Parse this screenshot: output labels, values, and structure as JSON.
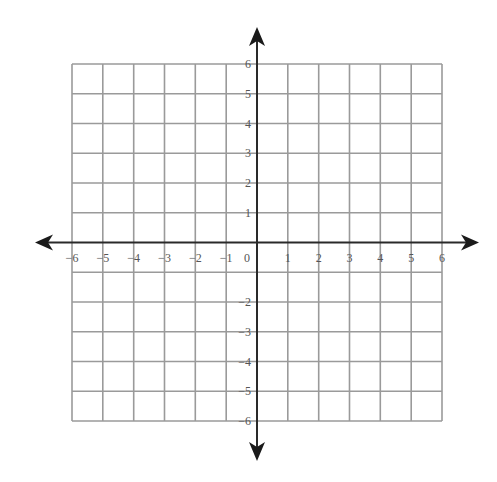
{
  "diagram": {
    "type": "coordinate-plane",
    "title": "",
    "x_axis": {
      "min": -6,
      "max": 6,
      "step": 1,
      "tick_labels": [
        "-6",
        "-5",
        "-4",
        "-3",
        "-2",
        "-1",
        "0",
        "1",
        "2",
        "3",
        "4",
        "5",
        "6"
      ],
      "arrows": [
        "left",
        "right"
      ]
    },
    "y_axis": {
      "min": -6,
      "max": 6,
      "step": 1,
      "tick_labels": [
        "6",
        "5",
        "4",
        "3",
        "2",
        "1",
        "-2",
        "-3",
        "-4",
        "-5",
        "-6"
      ],
      "omitted_labels": [
        "-1"
      ],
      "arrows": [
        "up",
        "down"
      ]
    },
    "grid": {
      "columns": 12,
      "rows": 12,
      "visible": true
    },
    "origin_label": "0",
    "colors": {
      "grid": "#9a9a9a",
      "axis": "#2a2a2a",
      "label": "#555555",
      "background": "#ffffff"
    }
  },
  "labels": {
    "x": {
      "neg6": "−6",
      "neg5": "−5",
      "neg4": "−4",
      "neg3": "−3",
      "neg2": "−2",
      "neg1": "−1",
      "zero": "0",
      "pos1": "1",
      "pos2": "2",
      "pos3": "3",
      "pos4": "4",
      "pos5": "5",
      "pos6": "6"
    },
    "y": {
      "pos6": "6",
      "pos5": "5",
      "pos4": "4",
      "pos3": "3",
      "pos2": "2",
      "pos1": "1",
      "neg2": "−2",
      "neg3": "−3",
      "neg4": "−4",
      "neg5": "−5",
      "neg6": "−6"
    }
  }
}
